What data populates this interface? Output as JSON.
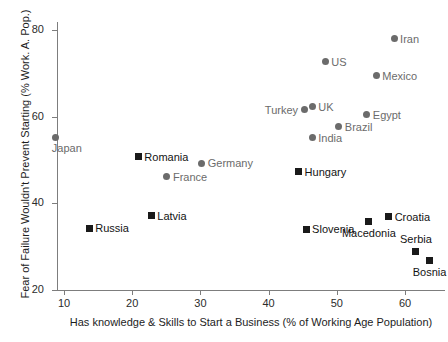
{
  "chart_data": {
    "type": "scatter",
    "title": "",
    "xlabel": "Has knowledge & Skills to Start a Business (% of Working Age Population)",
    "ylabel": "Fear of Failure Wouldn't Prevent Starting (% Work. A. Pop.)",
    "xlim": [
      6,
      63
    ],
    "ylim": [
      20,
      82
    ],
    "xticks": [
      10,
      20,
      30,
      40,
      50,
      60
    ],
    "xtick_labels": [
      "10",
      "20",
      "30",
      "40",
      "50",
      "60"
    ],
    "yticks": [
      20,
      40,
      60,
      80
    ],
    "ytick_labels": [
      "20",
      "40",
      "60",
      "80"
    ],
    "grid": false,
    "legend": "none",
    "marker_colors": {
      "circle": "#6b6b6b",
      "square": "#1a1a1a"
    },
    "points": [
      {
        "label": "Japan",
        "x": 8.8,
        "y": 55.3,
        "marker": "circle",
        "label_pos": "below"
      },
      {
        "label": "Romania",
        "x": 20.9,
        "y": 50.7,
        "marker": "square",
        "label_pos": "right"
      },
      {
        "label": "Germany",
        "x": 30.2,
        "y": 49.3,
        "marker": "circle",
        "label_pos": "right"
      },
      {
        "label": "France",
        "x": 25.1,
        "y": 46.1,
        "marker": "circle",
        "label_pos": "right"
      },
      {
        "label": "Latvia",
        "x": 22.8,
        "y": 37.1,
        "marker": "square",
        "label_pos": "right"
      },
      {
        "label": "Russia",
        "x": 13.7,
        "y": 34.3,
        "marker": "square",
        "label_pos": "right"
      },
      {
        "label": "Iran",
        "x": 58.4,
        "y": 78.0,
        "marker": "circle",
        "label_pos": "right"
      },
      {
        "label": "US",
        "x": 48.3,
        "y": 72.7,
        "marker": "circle",
        "label_pos": "right"
      },
      {
        "label": "Mexico",
        "x": 55.8,
        "y": 69.4,
        "marker": "circle",
        "label_pos": "right"
      },
      {
        "label": "Turkey",
        "x": 45.2,
        "y": 61.6,
        "marker": "circle",
        "label_pos": "left"
      },
      {
        "label": "UK",
        "x": 46.4,
        "y": 62.3,
        "marker": "circle",
        "label_pos": "right"
      },
      {
        "label": "Egypt",
        "x": 54.4,
        "y": 60.4,
        "marker": "circle",
        "label_pos": "right"
      },
      {
        "label": "Brazil",
        "x": 50.3,
        "y": 57.7,
        "marker": "circle",
        "label_pos": "right"
      },
      {
        "label": "India",
        "x": 46.4,
        "y": 55.1,
        "marker": "circle",
        "label_pos": "right"
      },
      {
        "label": "Hungary",
        "x": 44.4,
        "y": 47.3,
        "marker": "square",
        "label_pos": "right"
      },
      {
        "label": "Croatia",
        "x": 57.6,
        "y": 36.9,
        "marker": "square",
        "label_pos": "right"
      },
      {
        "label": "Macedonia",
        "x": 54.7,
        "y": 35.8,
        "marker": "square",
        "label_pos": "below-center"
      },
      {
        "label": "Slovenia",
        "x": 45.5,
        "y": 34.0,
        "marker": "square",
        "label_pos": "right"
      },
      {
        "label": "Serbia",
        "x": 61.6,
        "y": 28.9,
        "marker": "square",
        "label_pos": "above-center"
      },
      {
        "label": "Bosnia",
        "x": 63.6,
        "y": 26.8,
        "marker": "square",
        "label_pos": "below-center"
      }
    ]
  }
}
